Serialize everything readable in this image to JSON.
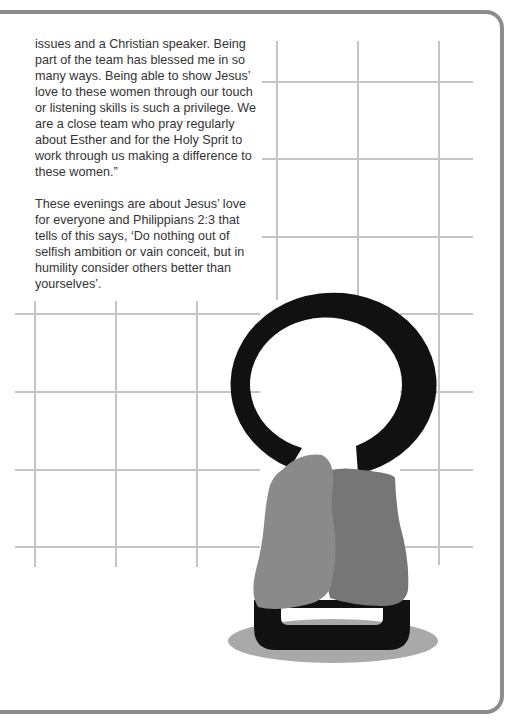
{
  "page": {
    "paragraphs": [
      "issues and a Christian speaker. Being part of the team has blessed me in so many ways. Being able to show Jesus’ love to these women through our touch or listening skills is such a privilege. We are a close team who pray regularly about Esther and for the Holy Sprit to work through us making a difference to these women.”",
      "These evenings are about Jesus’ love for everyone and Philippians 2:3 that tells of this says, ‘Do nothing out of selfish ambition or vain conceit, but in humility consider others better than yourselves’."
    ]
  },
  "illustration": {
    "name": "ring-with-figures",
    "colors": {
      "grid": "#c4c4c4",
      "ring": "#111111",
      "figure_left": "#8a8a8a",
      "figure_right": "#767676",
      "shadow": "#a9a9a9",
      "border": "#8c8c8c"
    }
  }
}
